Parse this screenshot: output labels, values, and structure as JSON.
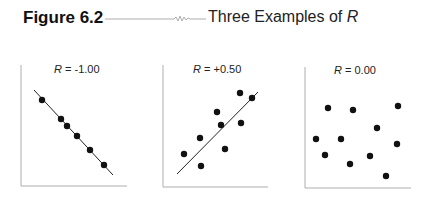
{
  "figure": {
    "label": "Figure 6.2",
    "title_prefix": "Three Examples of ",
    "title_var": "R"
  },
  "chart_data": [
    {
      "type": "scatter",
      "title": "R = -1.00",
      "r": -1.0,
      "points": [
        [
          42,
          100
        ],
        [
          61,
          119
        ],
        [
          67,
          126
        ],
        [
          77,
          136
        ],
        [
          90,
          150
        ],
        [
          104,
          165
        ]
      ],
      "fit_line": [
        [
          34,
          90
        ],
        [
          113,
          175
        ]
      ],
      "xlabel": "",
      "ylabel": "",
      "grid": false
    },
    {
      "type": "scatter",
      "title": "R = +0.50",
      "r": 0.5,
      "points": [
        [
          184,
          154
        ],
        [
          200,
          138
        ],
        [
          201,
          166
        ],
        [
          217,
          112
        ],
        [
          221,
          125
        ],
        [
          225,
          149
        ],
        [
          240,
          93
        ],
        [
          241,
          123
        ],
        [
          252,
          98
        ]
      ],
      "fit_line": [
        [
          177,
          174
        ],
        [
          258,
          92
        ]
      ],
      "xlabel": "",
      "ylabel": "",
      "grid": false
    },
    {
      "type": "scatter",
      "title": "R = 0.00",
      "r": 0.0,
      "points": [
        [
          328,
          108
        ],
        [
          353,
          110
        ],
        [
          398,
          106
        ],
        [
          377,
          128
        ],
        [
          316,
          139
        ],
        [
          341,
          139
        ],
        [
          397,
          144
        ],
        [
          325,
          155
        ],
        [
          370,
          156
        ],
        [
          350,
          164
        ],
        [
          386,
          176
        ]
      ],
      "fit_line": null,
      "xlabel": "",
      "ylabel": "",
      "grid": false
    }
  ],
  "panels": [
    {
      "var": "R",
      "value": " = -1.00"
    },
    {
      "var": "R",
      "value": " = +0.50"
    },
    {
      "var": "R",
      "value": " = 0.00"
    }
  ]
}
